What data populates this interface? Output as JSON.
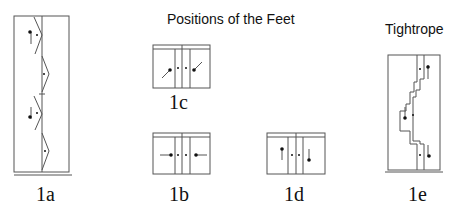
{
  "titles": {
    "positions": "Positions of the Feet",
    "tightrope": "Tightrope"
  },
  "figures": [
    {
      "id": "1a",
      "label": "1a",
      "description": "Walking pattern: alternating triangular foot outlines along a center line, with arrows pointing up and down"
    },
    {
      "id": "1b",
      "label": "1b",
      "description": "Feet pointing inward horizontally toward center line"
    },
    {
      "id": "1c",
      "label": "1c",
      "description": "Feet angled diagonally toward upper-right"
    },
    {
      "id": "1d",
      "label": "1d",
      "description": "Feet vertical: left foot pointing up, right foot pointing down"
    },
    {
      "id": "1e",
      "label": "1e",
      "description": "Tightrope: stepped path with foot markers and vertical arrows"
    }
  ],
  "colors": {
    "line": "#555555",
    "ink": "#111111",
    "background": "#ffffff"
  }
}
